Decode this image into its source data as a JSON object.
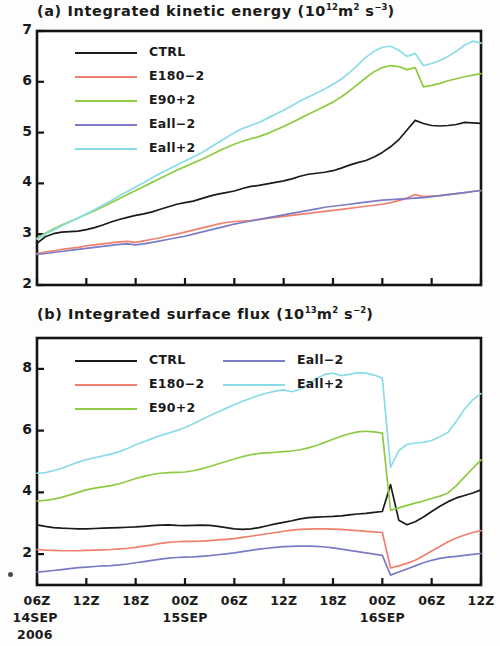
{
  "figure": {
    "x_axis": {
      "tick_labels": [
        "06Z",
        "12Z",
        "18Z",
        "00Z",
        "06Z",
        "12Z",
        "18Z",
        "00Z",
        "06Z",
        "12Z"
      ],
      "date_labels": [
        {
          "text": "14SEP",
          "tick_index": 0
        },
        {
          "text": "2006",
          "tick_index": 0
        },
        {
          "text": "15SEP",
          "tick_index": 3
        },
        {
          "text": "16SEP",
          "tick_index": 7
        }
      ],
      "hours": [
        0,
        6,
        12,
        18,
        24,
        30,
        36,
        42,
        48,
        54
      ]
    },
    "series_colors": {
      "CTRL": "#1b1b1b",
      "E180-2": "#f0806e",
      "E90+2": "#8ecb43",
      "Eall-2": "#7b7bc6",
      "Eall+2": "#8adce8"
    }
  },
  "panel_a": {
    "label": "(a)",
    "title_text": "Integrated kinetic energy",
    "unit_prefix": "(10",
    "unit_exp1": "12",
    "unit_mid": "m",
    "unit_exp2": "2",
    "unit_sp": " s",
    "unit_exp3": "−3",
    "unit_suffix": ")",
    "legend": {
      "columns": 1,
      "items": [
        {
          "label": "CTRL",
          "color": "#1b1b1b"
        },
        {
          "label": "E180−2",
          "color": "#f0806e"
        },
        {
          "label": "E90+2",
          "color": "#8ecb43"
        },
        {
          "label": "Eall−2",
          "color": "#7b7bc6"
        },
        {
          "label": "Eall+2",
          "color": "#8adce8"
        }
      ]
    },
    "y_ticks": [
      2,
      3,
      4,
      5,
      6,
      7
    ],
    "y_tick_labels": [
      "2",
      "3",
      "4",
      "5",
      "6",
      "7"
    ]
  },
  "panel_b": {
    "label": "(b)",
    "title_text": "Integrated surface flux",
    "unit_prefix": "(10",
    "unit_exp1": "13",
    "unit_mid": "m",
    "unit_exp2": "2",
    "unit_sp": " s",
    "unit_exp3": "−2",
    "unit_suffix": ")",
    "legend": {
      "columns": 2,
      "items": [
        {
          "label": "CTRL",
          "color": "#1b1b1b",
          "col": 0,
          "row": 0
        },
        {
          "label": "E180−2",
          "color": "#f0806e",
          "col": 0,
          "row": 1
        },
        {
          "label": "E90+2",
          "color": "#8ecb43",
          "col": 0,
          "row": 2
        },
        {
          "label": "Eall−2",
          "color": "#7b7bc6",
          "col": 1,
          "row": 0
        },
        {
          "label": "Eall+2",
          "color": "#8adce8",
          "col": 1,
          "row": 1
        }
      ]
    },
    "y_ticks": [
      2,
      4,
      6,
      8
    ],
    "y_tick_labels": [
      "2",
      "4",
      "6",
      "8"
    ]
  },
  "chart_data": [
    {
      "type": "line",
      "panel": "a",
      "title": "(a) Integrated kinetic energy (10^12 m^2 s^-3)",
      "xlabel": "",
      "ylabel": "",
      "xlim": [
        0,
        54
      ],
      "ylim": [
        2,
        7
      ],
      "grid": false,
      "legend_position": "upper-left",
      "x_unit": "hours since 06Z 14SEP 2006",
      "x": [
        0,
        1,
        2,
        3,
        4,
        5,
        6,
        7,
        8,
        9,
        10,
        11,
        12,
        13,
        14,
        15,
        16,
        17,
        18,
        19,
        20,
        21,
        22,
        23,
        24,
        25,
        26,
        27,
        28,
        29,
        30,
        31,
        32,
        33,
        34,
        35,
        36,
        37,
        38,
        39,
        40,
        41,
        42,
        43,
        44,
        45,
        46,
        47,
        48,
        49,
        50,
        51,
        52,
        53,
        54
      ],
      "series": [
        {
          "name": "CTRL",
          "color": "#1b1b1b",
          "values": [
            2.82,
            2.95,
            3.01,
            3.04,
            3.05,
            3.06,
            3.09,
            3.13,
            3.18,
            3.24,
            3.29,
            3.33,
            3.37,
            3.4,
            3.44,
            3.49,
            3.54,
            3.59,
            3.62,
            3.65,
            3.7,
            3.75,
            3.79,
            3.82,
            3.85,
            3.9,
            3.94,
            3.96,
            3.99,
            4.02,
            4.05,
            4.09,
            4.14,
            4.18,
            4.2,
            4.22,
            4.25,
            4.3,
            4.36,
            4.41,
            4.45,
            4.52,
            4.61,
            4.72,
            4.86,
            5.05,
            5.24,
            5.18,
            5.14,
            5.13,
            5.14,
            5.16,
            5.2,
            5.19,
            5.18
          ]
        },
        {
          "name": "E180-2",
          "color": "#f0806e",
          "values": [
            2.62,
            2.65,
            2.67,
            2.7,
            2.72,
            2.74,
            2.77,
            2.79,
            2.81,
            2.83,
            2.85,
            2.86,
            2.84,
            2.87,
            2.9,
            2.93,
            2.97,
            3.0,
            3.04,
            3.08,
            3.12,
            3.16,
            3.2,
            3.23,
            3.25,
            3.26,
            3.27,
            3.29,
            3.31,
            3.33,
            3.35,
            3.37,
            3.39,
            3.41,
            3.43,
            3.45,
            3.47,
            3.49,
            3.51,
            3.53,
            3.55,
            3.57,
            3.59,
            3.62,
            3.66,
            3.71,
            3.78,
            3.74,
            3.75,
            3.76,
            3.78,
            3.8,
            3.82,
            3.84,
            3.86
          ]
        },
        {
          "name": "E90+2",
          "color": "#8ecb43",
          "values": [
            2.92,
            3.02,
            3.1,
            3.18,
            3.25,
            3.32,
            3.39,
            3.46,
            3.54,
            3.62,
            3.7,
            3.78,
            3.86,
            3.94,
            4.02,
            4.1,
            4.18,
            4.26,
            4.33,
            4.4,
            4.47,
            4.55,
            4.63,
            4.7,
            4.77,
            4.83,
            4.88,
            4.92,
            4.98,
            5.05,
            5.12,
            5.2,
            5.28,
            5.36,
            5.44,
            5.52,
            5.6,
            5.7,
            5.82,
            5.95,
            6.08,
            6.2,
            6.28,
            6.32,
            6.3,
            6.24,
            6.28,
            5.9,
            5.93,
            5.97,
            6.02,
            6.06,
            6.1,
            6.13,
            6.16
          ]
        },
        {
          "name": "Eall-2",
          "color": "#7b7bc6",
          "values": [
            2.6,
            2.62,
            2.64,
            2.66,
            2.68,
            2.7,
            2.72,
            2.74,
            2.76,
            2.78,
            2.8,
            2.81,
            2.79,
            2.81,
            2.84,
            2.87,
            2.9,
            2.93,
            2.96,
            3.0,
            3.04,
            3.08,
            3.12,
            3.16,
            3.2,
            3.23,
            3.26,
            3.29,
            3.32,
            3.35,
            3.38,
            3.41,
            3.44,
            3.47,
            3.5,
            3.53,
            3.55,
            3.57,
            3.59,
            3.61,
            3.63,
            3.65,
            3.67,
            3.68,
            3.69,
            3.7,
            3.71,
            3.72,
            3.74,
            3.76,
            3.78,
            3.8,
            3.82,
            3.84,
            3.86
          ]
        },
        {
          "name": "Eall+2",
          "color": "#8adce8",
          "values": [
            2.9,
            3.0,
            3.08,
            3.16,
            3.24,
            3.32,
            3.4,
            3.48,
            3.57,
            3.66,
            3.75,
            3.84,
            3.93,
            4.02,
            4.11,
            4.2,
            4.28,
            4.36,
            4.44,
            4.52,
            4.6,
            4.7,
            4.8,
            4.9,
            5.0,
            5.08,
            5.14,
            5.2,
            5.28,
            5.36,
            5.44,
            5.53,
            5.62,
            5.7,
            5.78,
            5.86,
            5.95,
            6.05,
            6.18,
            6.33,
            6.48,
            6.6,
            6.68,
            6.7,
            6.62,
            6.5,
            6.56,
            6.32,
            6.36,
            6.42,
            6.5,
            6.6,
            6.72,
            6.8,
            6.76
          ]
        }
      ]
    },
    {
      "type": "line",
      "panel": "b",
      "title": "(b) Integrated surface flux (10^13 m^2 s^-2)",
      "xlabel": "",
      "ylabel": "",
      "xlim": [
        0,
        54
      ],
      "ylim": [
        1,
        9
      ],
      "grid": false,
      "legend_position": "upper-left",
      "x_unit": "hours since 06Z 14SEP 2006",
      "x": [
        0,
        1,
        2,
        3,
        4,
        5,
        6,
        7,
        8,
        9,
        10,
        11,
        12,
        13,
        14,
        15,
        16,
        17,
        18,
        19,
        20,
        21,
        22,
        23,
        24,
        25,
        26,
        27,
        28,
        29,
        30,
        31,
        32,
        33,
        34,
        35,
        36,
        37,
        38,
        39,
        40,
        41,
        42,
        43,
        44,
        45,
        46,
        47,
        48,
        49,
        50,
        51,
        52,
        53,
        54
      ],
      "series": [
        {
          "name": "CTRL",
          "color": "#1b1b1b",
          "values": [
            2.95,
            2.9,
            2.86,
            2.84,
            2.83,
            2.82,
            2.82,
            2.83,
            2.84,
            2.85,
            2.86,
            2.87,
            2.88,
            2.9,
            2.92,
            2.94,
            2.95,
            2.93,
            2.92,
            2.93,
            2.94,
            2.93,
            2.9,
            2.86,
            2.82,
            2.8,
            2.82,
            2.86,
            2.92,
            2.98,
            3.03,
            3.08,
            3.14,
            3.18,
            3.2,
            3.21,
            3.22,
            3.24,
            3.27,
            3.3,
            3.32,
            3.35,
            3.38,
            4.25,
            3.1,
            2.95,
            3.05,
            3.2,
            3.38,
            3.55,
            3.7,
            3.82,
            3.9,
            3.98,
            4.08
          ]
        },
        {
          "name": "E180-2",
          "color": "#f0806e",
          "values": [
            2.15,
            2.13,
            2.12,
            2.11,
            2.11,
            2.11,
            2.12,
            2.13,
            2.14,
            2.15,
            2.17,
            2.19,
            2.22,
            2.26,
            2.3,
            2.35,
            2.38,
            2.4,
            2.41,
            2.41,
            2.42,
            2.44,
            2.46,
            2.48,
            2.5,
            2.54,
            2.58,
            2.62,
            2.66,
            2.7,
            2.74,
            2.78,
            2.8,
            2.81,
            2.82,
            2.82,
            2.81,
            2.8,
            2.78,
            2.76,
            2.74,
            2.72,
            2.7,
            1.55,
            1.62,
            1.7,
            1.8,
            1.95,
            2.1,
            2.25,
            2.4,
            2.52,
            2.62,
            2.7,
            2.76
          ]
        },
        {
          "name": "E90+2",
          "color": "#8ecb43",
          "values": [
            3.72,
            3.74,
            3.78,
            3.84,
            3.92,
            4.0,
            4.08,
            4.14,
            4.18,
            4.22,
            4.28,
            4.36,
            4.45,
            4.52,
            4.58,
            4.62,
            4.64,
            4.65,
            4.66,
            4.7,
            4.76,
            4.84,
            4.92,
            5.0,
            5.08,
            5.16,
            5.22,
            5.26,
            5.28,
            5.3,
            5.32,
            5.34,
            5.38,
            5.44,
            5.52,
            5.62,
            5.72,
            5.82,
            5.9,
            5.96,
            5.98,
            5.96,
            5.92,
            3.42,
            3.5,
            3.58,
            3.65,
            3.72,
            3.8,
            3.88,
            3.98,
            4.22,
            4.5,
            4.78,
            5.05
          ]
        },
        {
          "name": "Eall-2",
          "color": "#7b7bc6",
          "values": [
            1.42,
            1.44,
            1.47,
            1.5,
            1.53,
            1.56,
            1.58,
            1.6,
            1.62,
            1.63,
            1.65,
            1.68,
            1.72,
            1.76,
            1.8,
            1.84,
            1.87,
            1.89,
            1.9,
            1.91,
            1.93,
            1.95,
            1.98,
            2.01,
            2.04,
            2.08,
            2.12,
            2.16,
            2.19,
            2.22,
            2.24,
            2.25,
            2.26,
            2.26,
            2.25,
            2.23,
            2.2,
            2.16,
            2.12,
            2.08,
            2.04,
            2.0,
            1.96,
            1.32,
            1.42,
            1.52,
            1.62,
            1.72,
            1.8,
            1.86,
            1.9,
            1.93,
            1.96,
            1.99,
            2.02
          ]
        },
        {
          "name": "Eall+2",
          "color": "#8adce8",
          "values": [
            4.62,
            4.64,
            4.7,
            4.78,
            4.88,
            4.98,
            5.06,
            5.12,
            5.18,
            5.24,
            5.32,
            5.42,
            5.54,
            5.64,
            5.74,
            5.84,
            5.92,
            6.0,
            6.1,
            6.22,
            6.35,
            6.48,
            6.6,
            6.72,
            6.84,
            6.95,
            7.05,
            7.14,
            7.22,
            7.28,
            7.32,
            7.26,
            7.34,
            7.5,
            7.68,
            7.82,
            7.86,
            7.78,
            7.82,
            7.88,
            7.86,
            7.8,
            7.7,
            4.82,
            5.35,
            5.55,
            5.6,
            5.62,
            5.68,
            5.8,
            5.95,
            6.3,
            6.7,
            7.0,
            7.2
          ]
        }
      ]
    }
  ]
}
